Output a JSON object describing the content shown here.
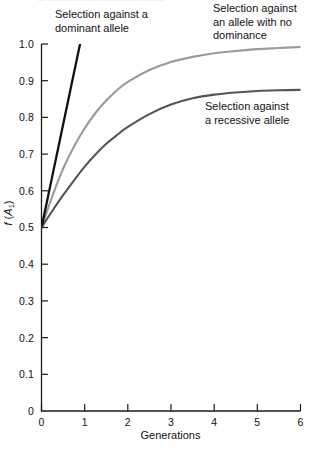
{
  "figure": {
    "top_cut_text": "— ——— — —— ———— ———"
  },
  "annotations": {
    "dominant": "Selection against a\ndominant allele",
    "no_dominance": "Selection against\nan allele with no\ndominance",
    "recessive": "Selection against\na recessive allele"
  },
  "axes": {
    "x_title": "Generations",
    "y_title_main": "f",
    "y_title_allele": "A",
    "y_title_sub": "1",
    "y_ticks": [
      "1.0",
      "0.9",
      "0.8",
      "0.7",
      "0.6",
      "0.5",
      "0.4",
      "0.3",
      "0.2",
      "0.1",
      "0"
    ],
    "x_ticks": [
      "0",
      "1",
      "2",
      "3",
      "4",
      "5",
      "6"
    ]
  },
  "colors": {
    "axis": "#1a1a1a",
    "dominant": "#111111",
    "no_dominance": "#9a9a9a",
    "recessive": "#555555",
    "background": "#ffffff"
  },
  "chart_data": {
    "type": "line",
    "title": "",
    "subtitle": "",
    "xlabel": "Generations",
    "ylabel": "f (A1)",
    "xlim": [
      0,
      6
    ],
    "ylim": [
      0,
      1.0
    ],
    "xticks": [
      0,
      1,
      2,
      3,
      4,
      5,
      6
    ],
    "yticks": [
      0,
      0.1,
      0.2,
      0.3,
      0.4,
      0.5,
      0.6,
      0.7,
      0.8,
      0.9,
      1.0
    ],
    "grid": false,
    "legend": "none (curves labelled with inline annotations)",
    "x": [
      0,
      0.25,
      0.5,
      0.75,
      1,
      1.25,
      1.5,
      1.75,
      2,
      2.5,
      3,
      3.5,
      4,
      4.5,
      5,
      5.5,
      6
    ],
    "series": [
      {
        "name": "Selection against a dominant allele",
        "color": "#111111",
        "note": "rises steeply and leaves the top of the plot near generation 0.9",
        "values": [
          0.5,
          0.64,
          0.78,
          0.92,
          1.06,
          null,
          null,
          null,
          null,
          null,
          null,
          null,
          null,
          null,
          null,
          null,
          null
        ],
        "clipped_at_generation": 0.9
      },
      {
        "name": "Selection against an allele with no dominance",
        "color": "#9a9a9a",
        "values": [
          0.5,
          0.585,
          0.66,
          0.72,
          0.77,
          0.812,
          0.846,
          0.874,
          0.897,
          0.929,
          0.951,
          0.965,
          0.975,
          0.981,
          0.986,
          0.989,
          0.992
        ]
      },
      {
        "name": "Selection against a recessive allele",
        "color": "#555555",
        "values": [
          0.5,
          0.545,
          0.588,
          0.628,
          0.666,
          0.699,
          0.728,
          0.752,
          0.774,
          0.809,
          0.835,
          0.852,
          0.862,
          0.868,
          0.872,
          0.874,
          0.875
        ]
      }
    ],
    "annotations": [
      {
        "text": "Selection against a dominant allele",
        "target_series": "Selection against a dominant allele"
      },
      {
        "text": "Selection against an allele with no dominance",
        "target_series": "Selection against an allele with no dominance"
      },
      {
        "text": "Selection against a recessive allele",
        "target_series": "Selection against a recessive allele"
      }
    ]
  }
}
